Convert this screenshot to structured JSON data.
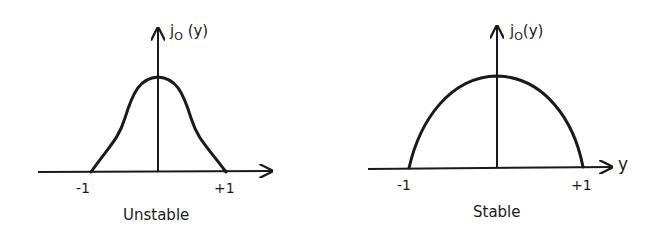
{
  "figure": {
    "panels": [
      {
        "id": "unstable",
        "caption": "Unstable",
        "y_axis_label": {
          "base": "j",
          "subscript": "O",
          "arg": "(y)"
        },
        "x_axis_label": "",
        "ticks": {
          "left": "-1",
          "right": "+1"
        },
        "curve_shape": "bell-shaped (Gaussian-like) profile peaked at y=0, zero at y=±1"
      },
      {
        "id": "stable",
        "caption": "Stable",
        "y_axis_label": {
          "base": "j",
          "subscript": "O",
          "arg": "(y)"
        },
        "x_axis_label": "y",
        "ticks": {
          "left": "-1",
          "right": "+1"
        },
        "curve_shape": "parabolic (dome) profile peaked at y=0, zero at y=±1"
      }
    ],
    "colors": {
      "ink": "#1a1a1a",
      "background": "#ffffff"
    }
  }
}
